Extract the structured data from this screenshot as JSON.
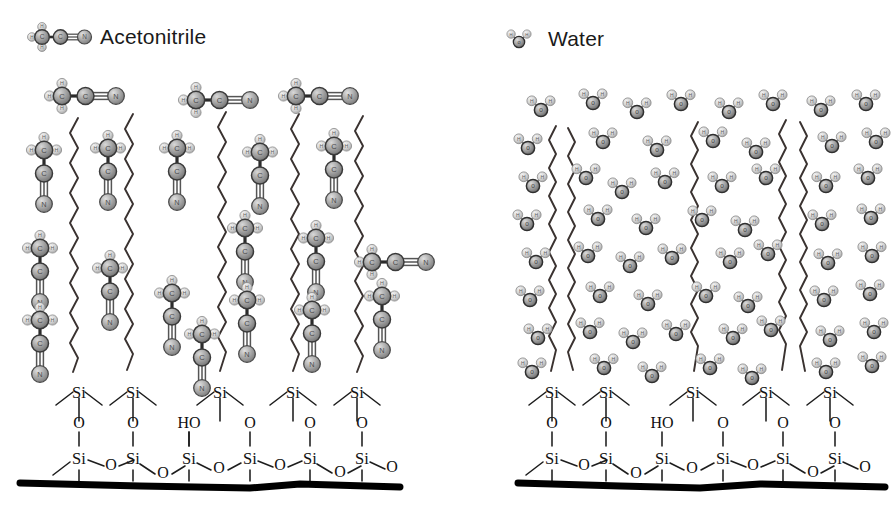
{
  "figure": {
    "kind": "molecular-schematic"
  },
  "legends": [
    {
      "id": "acetonitrile",
      "label": "Acetonitrile",
      "icon": "acetonitrile-molecule-icon",
      "x": 100,
      "y": 25
    },
    {
      "id": "water",
      "label": "Water",
      "icon": "water-molecule-icon",
      "x": 548,
      "y": 27
    }
  ],
  "atom_labels": {
    "carbon": "C",
    "hydrogen": "H",
    "nitrogen": "N",
    "oxygen": "O",
    "silicon": "Si",
    "hydroxyl": "HO",
    "water_oxygen": "o",
    "water_hydrogen": "H"
  },
  "colors": {
    "carbon": "#9a9a9a",
    "carbon_dark": "#8a8a8a",
    "hydrogen": "#cfcfcf",
    "nitrogen": "#a8a8a8",
    "oxygen_sphere": "#b5b5b5",
    "bond": "#2b2b2b",
    "chain": "#3a3230",
    "substrate": "#000000",
    "text": "#1a1a1a",
    "background": "#ffffff"
  },
  "panels": [
    {
      "id": "acetonitrile-panel",
      "name": "Acetonitrile solvated C18 phase",
      "solvent": "acetonitrile",
      "x_range": [
        10,
        410
      ],
      "substrate": {
        "name": "silica-substrate",
        "bar_y": 478,
        "bar_x0": 20,
        "bar_x1": 400,
        "upper_si_count": 5,
        "lower_si_count": 6,
        "silanol_label": "HO",
        "silanol_index": 2
      },
      "chains": {
        "name": "c18-alkyl-chains",
        "count": 5,
        "description": "zigzag octadecyl chains anchored to surface silicon atoms, extended and spread apart",
        "state": "extended"
      },
      "solvent_molecules": {
        "count": 20,
        "orientation_note": "mostly vertical with methyl up and nitrile nitrogen down, several horizontal near the top"
      }
    },
    {
      "id": "water-panel",
      "name": "Water solvated C18 phase",
      "solvent": "water",
      "x_range": [
        500,
        885
      ],
      "substrate": {
        "name": "silica-substrate",
        "bar_y": 478,
        "bar_x0": 518,
        "bar_x1": 885,
        "upper_si_count": 5,
        "lower_si_count": 6,
        "silanol_label": "HO",
        "silanol_index": 2
      },
      "chains": {
        "name": "c18-alkyl-chains",
        "count": 5,
        "description": "zigzag octadecyl chains collapsed and paired together, excluded from water",
        "state": "collapsed"
      },
      "solvent_molecules": {
        "count": 86,
        "orientation_note": "bent triatomic water molecules densely filling the region above and between chains"
      }
    }
  ]
}
